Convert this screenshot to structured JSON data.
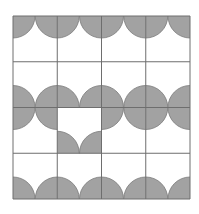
{
  "figure": {
    "grid": {
      "origin_x": 13,
      "origin_y": 16,
      "cell_width": 44.25,
      "cell_height": 45.75,
      "rows": 4,
      "cols": 4,
      "radius": 22
    },
    "colors": {
      "background": "#ffffff",
      "fill": "#a2a2a2",
      "line": "#6e6e6e",
      "arc_stroke": "#7a7a7a"
    },
    "cells": [
      [
        "top",
        "top",
        "top",
        "top"
      ],
      [
        "bottom",
        "bottom",
        "bottom",
        "bottom"
      ],
      [
        "top",
        "bottom",
        "top",
        "top"
      ],
      [
        "bottom",
        "bottom",
        "bottom",
        "bottom"
      ]
    ],
    "odd_cell": {
      "row": 2,
      "col": 1
    }
  }
}
